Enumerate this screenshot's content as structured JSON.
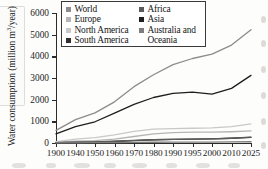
{
  "chart_data": {
    "type": "line",
    "title": "",
    "xlabel": "",
    "ylabel": "Water consumption (million m³/year)",
    "ylabel_main": "Water consumption (million m",
    "ylabel_sup": "3",
    "ylabel_tail": "/year)",
    "grid": false,
    "legend_position": "top-inside",
    "ylim": [
      0,
      6000
    ],
    "yticks": [
      0,
      1000,
      2000,
      3000,
      4000,
      5000,
      6000
    ],
    "ytick_labels": [
      "0",
      "1000",
      "2000",
      "3000",
      "4000",
      "5000",
      "6000"
    ],
    "categories": [
      "1900",
      "1940",
      "1950",
      "1960",
      "1970",
      "1980",
      "1990",
      "1995",
      "2000",
      "2010",
      "2025"
    ],
    "x": [
      1900,
      1940,
      1950,
      1960,
      1970,
      1980,
      1990,
      1995,
      2000,
      2010,
      2025
    ],
    "series": [
      {
        "name": "World",
        "color": "#8c8c8c",
        "values": [
          580,
          1080,
          1390,
          1900,
          2600,
          3150,
          3620,
          3900,
          4100,
          4520,
          5230
        ]
      },
      {
        "name": "Europe",
        "color": "#b5b5b5",
        "values": [
          40,
          80,
          110,
          180,
          300,
          420,
          480,
          500,
          500,
          520,
          560
        ]
      },
      {
        "name": "North America",
        "color": "#c9c9c9",
        "values": [
          60,
          180,
          250,
          380,
          540,
          640,
          660,
          680,
          700,
          760,
          880
        ]
      },
      {
        "name": "South America",
        "color": "#2f2f2f",
        "values": [
          15,
          30,
          45,
          70,
          110,
          150,
          170,
          180,
          190,
          220,
          260
        ]
      },
      {
        "name": "Africa",
        "color": "#5a5a5a",
        "values": [
          20,
          40,
          55,
          80,
          120,
          150,
          170,
          180,
          190,
          220,
          270
        ]
      },
      {
        "name": "Asia",
        "color": "#1e1e1e",
        "values": [
          420,
          760,
          980,
          1380,
          1780,
          2100,
          2290,
          2350,
          2260,
          2520,
          3120
        ]
      },
      {
        "name": "Australia and Oceania",
        "color": "#7d7d7d",
        "values": [
          5,
          10,
          14,
          20,
          28,
          34,
          38,
          40,
          42,
          48,
          58
        ]
      }
    ]
  },
  "legend": {
    "left_column": [
      {
        "label": "World",
        "color": "#8c8c8c"
      },
      {
        "label": "Europe",
        "color": "#b5b5b5"
      },
      {
        "label": "North America",
        "color": "#c9c9c9"
      },
      {
        "label": "South America",
        "color": "#2f2f2f"
      }
    ],
    "right_column": [
      {
        "label": "Africa",
        "color": "#5a5a5a"
      },
      {
        "label": "Asia",
        "color": "#1e1e1e"
      },
      {
        "label": "Australia and",
        "color": "#7d7d7d"
      }
    ],
    "right_column_continuation": "Oceania"
  }
}
